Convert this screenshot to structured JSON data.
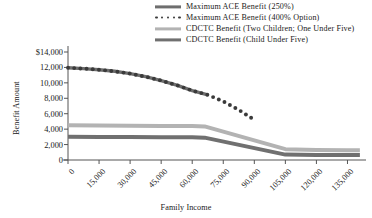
{
  "chart_data": {
    "type": "line",
    "title": "",
    "xlabel": "Family Income",
    "ylabel": "Benefit Amount",
    "xlim": [
      0,
      142500
    ],
    "ylim": [
      0,
      14000
    ],
    "grid": false,
    "legend_position": "top-right",
    "x_tick_labels": [
      "0",
      "15,000",
      "30,000",
      "45,000",
      "60,000",
      "75,000",
      "90,000",
      "105,000",
      "120,000",
      "135,000"
    ],
    "x_ticks": [
      0,
      15000,
      30000,
      45000,
      60000,
      75000,
      90000,
      105000,
      120000,
      135000
    ],
    "y_tick_labels": [
      "$14,000",
      "12,000",
      "10,000",
      "8,000",
      "6,000",
      "4,000",
      "2,000",
      "0"
    ],
    "y_ticks": [
      14000,
      12000,
      10000,
      8000,
      6000,
      4000,
      2000,
      0
    ],
    "series": [
      {
        "name": "Maximum ACE Benefit (250%)",
        "style": "solid",
        "color": "#6e6e6e",
        "width": 3.4,
        "x": [
          0,
          7500,
          15000,
          22500,
          30000,
          37500,
          45000,
          52500,
          60000,
          67500
        ],
        "values": [
          11950,
          11850,
          11700,
          11500,
          11200,
          10800,
          10300,
          9700,
          9000,
          8450
        ]
      },
      {
        "name": "Maximum ACE Benefit (400% Option)",
        "style": "dotted",
        "color": "#3a3a3a",
        "width": 3.2,
        "x": [
          0,
          7500,
          15000,
          22500,
          30000,
          37500,
          45000,
          52500,
          60000,
          67500,
          75000,
          82500,
          90000
        ],
        "values": [
          11950,
          11850,
          11700,
          11500,
          11200,
          10800,
          10300,
          9700,
          9000,
          8450,
          7600,
          6500,
          5200
        ]
      },
      {
        "name": "CDCTC Benefit (Two Children; One Under Five)",
        "style": "solid",
        "color": "#b3b3b3",
        "width": 4.0,
        "x": [
          0,
          15000,
          30000,
          45000,
          60000,
          66000,
          105000,
          120000,
          135000,
          141000
        ],
        "values": [
          4500,
          4480,
          4450,
          4420,
          4400,
          4350,
          1400,
          1300,
          1250,
          1250
        ]
      },
      {
        "name": "CDCTC Benefit (Child Under Five)",
        "style": "solid",
        "color": "#707070",
        "width": 4.0,
        "x": [
          0,
          15000,
          30000,
          45000,
          60000,
          66000,
          105000,
          120000,
          135000,
          141000
        ],
        "values": [
          3000,
          2990,
          2980,
          2960,
          2950,
          2900,
          700,
          660,
          640,
          640
        ]
      }
    ]
  },
  "legend": {
    "items": [
      {
        "label": "Maximum ACE Benefit (250%)",
        "style": "solid",
        "color": "#6e6e6e"
      },
      {
        "label": "Maximum ACE Benefit (400% Option)",
        "style": "dotted",
        "color": "#3a3a3a"
      },
      {
        "label": "CDCTC Benefit (Two Children; One Under Five)",
        "style": "solid",
        "color": "#b3b3b3"
      },
      {
        "label": "CDCTC Benefit (Child Under Five)",
        "style": "solid",
        "color": "#707070"
      }
    ]
  },
  "axes": {
    "y_title": "Benefit Amount",
    "x_title": "Family Income"
  }
}
